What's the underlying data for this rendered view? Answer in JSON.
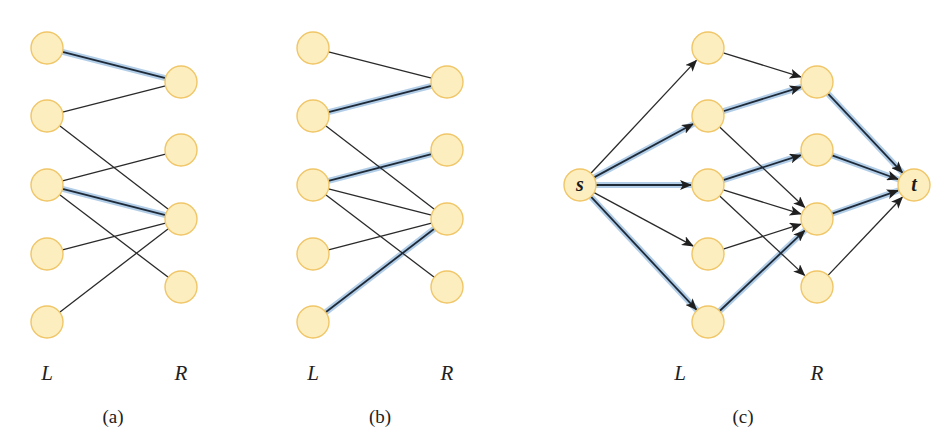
{
  "panels": [
    {
      "id": "a",
      "caption": "(a)",
      "left_label": "L",
      "right_label": "R",
      "left_x": 47,
      "right_x": 181,
      "left_nodes_y": [
        48,
        116,
        185,
        254,
        322
      ],
      "right_nodes_y": [
        82,
        150,
        219,
        287
      ],
      "edges": [
        {
          "from": [
            "L",
            0
          ],
          "to": [
            "R",
            0
          ],
          "matched": true
        },
        {
          "from": [
            "L",
            1
          ],
          "to": [
            "R",
            0
          ],
          "matched": false
        },
        {
          "from": [
            "L",
            1
          ],
          "to": [
            "R",
            2
          ],
          "matched": false
        },
        {
          "from": [
            "L",
            2
          ],
          "to": [
            "R",
            1
          ],
          "matched": false
        },
        {
          "from": [
            "L",
            2
          ],
          "to": [
            "R",
            2
          ],
          "matched": true
        },
        {
          "from": [
            "L",
            2
          ],
          "to": [
            "R",
            3
          ],
          "matched": false
        },
        {
          "from": [
            "L",
            3
          ],
          "to": [
            "R",
            2
          ],
          "matched": false
        },
        {
          "from": [
            "L",
            4
          ],
          "to": [
            "R",
            2
          ],
          "matched": false
        }
      ]
    },
    {
      "id": "b",
      "caption": "(b)",
      "left_label": "L",
      "right_label": "R",
      "left_x": 313,
      "right_x": 447,
      "left_nodes_y": [
        48,
        116,
        185,
        254,
        322
      ],
      "right_nodes_y": [
        82,
        150,
        219,
        287
      ],
      "edges": [
        {
          "from": [
            "L",
            0
          ],
          "to": [
            "R",
            0
          ],
          "matched": false
        },
        {
          "from": [
            "L",
            1
          ],
          "to": [
            "R",
            0
          ],
          "matched": true
        },
        {
          "from": [
            "L",
            1
          ],
          "to": [
            "R",
            2
          ],
          "matched": false
        },
        {
          "from": [
            "L",
            2
          ],
          "to": [
            "R",
            1
          ],
          "matched": true
        },
        {
          "from": [
            "L",
            2
          ],
          "to": [
            "R",
            2
          ],
          "matched": false
        },
        {
          "from": [
            "L",
            2
          ],
          "to": [
            "R",
            3
          ],
          "matched": false
        },
        {
          "from": [
            "L",
            3
          ],
          "to": [
            "R",
            2
          ],
          "matched": false
        },
        {
          "from": [
            "L",
            4
          ],
          "to": [
            "R",
            2
          ],
          "matched": true
        }
      ]
    }
  ],
  "flow_panel": {
    "id": "c",
    "caption": "(c)",
    "left_label": "L",
    "right_label": "R",
    "source_label": "s",
    "sink_label": "t",
    "source": [
      580,
      185
    ],
    "sink": [
      914,
      185
    ],
    "left_x": 708,
    "right_x": 817,
    "left_nodes_y": [
      48,
      116,
      185,
      254,
      322
    ],
    "right_nodes_y": [
      82,
      150,
      219,
      287
    ],
    "edges": [
      {
        "from": [
          "s",
          0
        ],
        "to": [
          "L",
          0
        ],
        "flow": false
      },
      {
        "from": [
          "s",
          0
        ],
        "to": [
          "L",
          1
        ],
        "flow": true
      },
      {
        "from": [
          "s",
          0
        ],
        "to": [
          "L",
          2
        ],
        "flow": true
      },
      {
        "from": [
          "s",
          0
        ],
        "to": [
          "L",
          3
        ],
        "flow": false
      },
      {
        "from": [
          "s",
          0
        ],
        "to": [
          "L",
          4
        ],
        "flow": true
      },
      {
        "from": [
          "L",
          0
        ],
        "to": [
          "R",
          0
        ],
        "flow": false
      },
      {
        "from": [
          "L",
          1
        ],
        "to": [
          "R",
          0
        ],
        "flow": true
      },
      {
        "from": [
          "L",
          1
        ],
        "to": [
          "R",
          2
        ],
        "flow": false
      },
      {
        "from": [
          "L",
          2
        ],
        "to": [
          "R",
          1
        ],
        "flow": true
      },
      {
        "from": [
          "L",
          2
        ],
        "to": [
          "R",
          2
        ],
        "flow": false
      },
      {
        "from": [
          "L",
          2
        ],
        "to": [
          "R",
          3
        ],
        "flow": false
      },
      {
        "from": [
          "L",
          3
        ],
        "to": [
          "R",
          2
        ],
        "flow": false
      },
      {
        "from": [
          "L",
          4
        ],
        "to": [
          "R",
          2
        ],
        "flow": true
      },
      {
        "from": [
          "R",
          0
        ],
        "to": [
          "t",
          0
        ],
        "flow": true
      },
      {
        "from": [
          "R",
          1
        ],
        "to": [
          "t",
          0
        ],
        "flow": true
      },
      {
        "from": [
          "R",
          2
        ],
        "to": [
          "t",
          0
        ],
        "flow": true
      },
      {
        "from": [
          "R",
          3
        ],
        "to": [
          "t",
          0
        ],
        "flow": false
      }
    ]
  },
  "style": {
    "node_fill": "#fdeebf",
    "node_stroke": "#f0c668",
    "highlight_color": "#a9c8e4",
    "edge_color": "#2a2a2a",
    "node_radius": 16
  },
  "labels": {
    "a_L": {
      "text": "L",
      "x": 47,
      "y": 373
    },
    "a_R": {
      "text": "R",
      "x": 181,
      "y": 373
    },
    "b_L": {
      "text": "L",
      "x": 313,
      "y": 373
    },
    "b_R": {
      "text": "R",
      "x": 447,
      "y": 373
    },
    "c_L": {
      "text": "L",
      "x": 680,
      "y": 373
    },
    "c_R": {
      "text": "R",
      "x": 817,
      "y": 373
    },
    "cap_a": {
      "text": "(a)",
      "x": 113,
      "y": 417
    },
    "cap_b": {
      "text": "(b)",
      "x": 380,
      "y": 417
    },
    "cap_c": {
      "text": "(c)",
      "x": 743,
      "y": 417
    }
  }
}
